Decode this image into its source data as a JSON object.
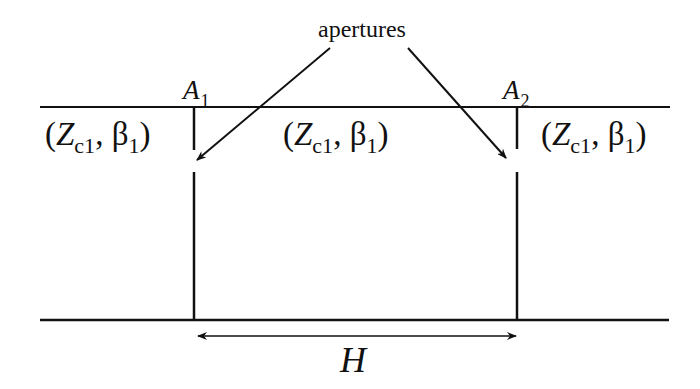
{
  "diagram": {
    "title_label": "apertures",
    "aperture_labels": [
      {
        "name": "A",
        "sub": "1"
      },
      {
        "name": "A",
        "sub": "2"
      }
    ],
    "regions": [
      {
        "open": "(",
        "z": "Z",
        "z_sub": "c1",
        "sep": ", ",
        "beta": "β",
        "beta_sub": "1",
        "close": ")"
      },
      {
        "open": "(",
        "z": "Z",
        "z_sub": "c1",
        "sep": ", ",
        "beta": "β",
        "beta_sub": "1",
        "close": ")"
      },
      {
        "open": "(",
        "z": "Z",
        "z_sub": "c1",
        "sep": ", ",
        "beta": "β",
        "beta_sub": "1",
        "close": ")"
      }
    ],
    "dimension_label": "H",
    "colors": {
      "line": "#111111",
      "background": "#ffffff"
    }
  }
}
